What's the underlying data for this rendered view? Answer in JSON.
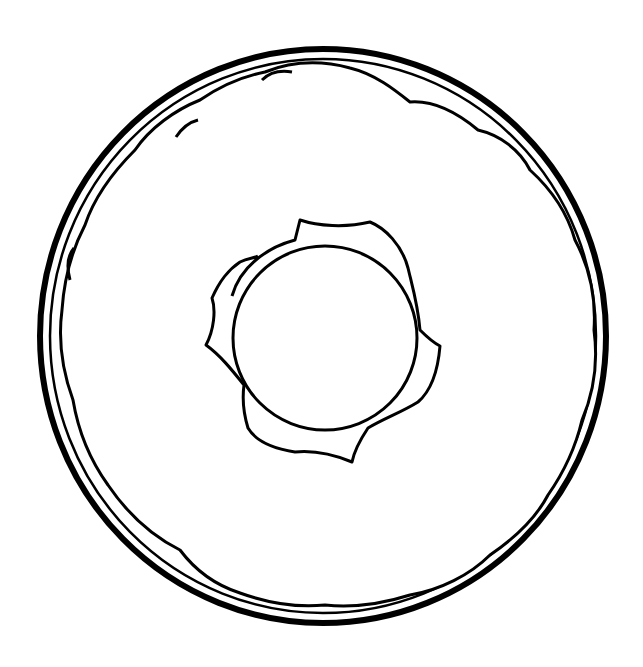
{
  "image": {
    "subject": "Donut line-art drawing",
    "style": "black outline on white background",
    "colors": {
      "background": "#ffffff",
      "ink": "#000000"
    },
    "parts": [
      "outer-ring",
      "icing-outline",
      "donut-hole",
      "hole-inner-edge"
    ]
  }
}
